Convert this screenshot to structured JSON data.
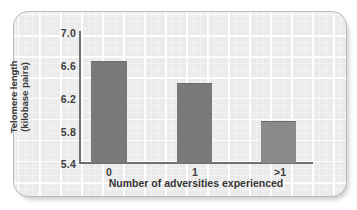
{
  "chart_data": {
    "type": "bar",
    "title": "",
    "subtitle": "",
    "categories": [
      "0",
      "1",
      ">1"
    ],
    "values": [
      6.63,
      6.36,
      5.9
    ],
    "series": [
      {
        "name": "Telomere length",
        "values": [
          6.63,
          6.36,
          5.9
        ]
      }
    ],
    "xlabel": "Number of adversities experienced",
    "ylabel": "Telomere length (kilobase pairs)",
    "ylabel_lines": [
      "Telomere length",
      "(kilobase pairs)"
    ],
    "ylim": [
      5.4,
      7.0
    ],
    "yticks": [
      "7.0",
      "6.6",
      "6.2",
      "5.8",
      "5.4"
    ],
    "ytick_values": [
      7.0,
      6.6,
      6.2,
      5.8,
      5.4
    ],
    "xticks": [
      "0",
      "1",
      ">1"
    ],
    "grid": true,
    "grid_color": "#ffffff",
    "legend": null,
    "legend_position": "none",
    "annotations": [],
    "colors": {
      "bar": "#797979",
      "plot_background": "#ebebeb",
      "frame_border": "#b9b9b9",
      "axis_line": "#6f6f6f",
      "text": "#3b3b3b"
    }
  }
}
